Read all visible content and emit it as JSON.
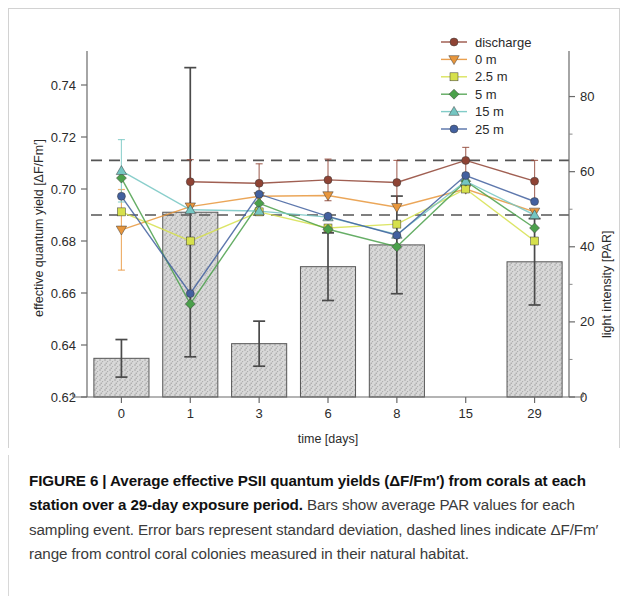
{
  "figure": {
    "caption_bold": "FIGURE 6 | Average effective PSII quantum yields (ΔF/Fm′) from corals at each station over a 29-day exposure period.",
    "caption_rest": " Bars show average PAR values for each sampling event. Error bars represent standard deviation, dashed lines indicate ΔF/Fm′ range from control coral colonies measured in their natural habitat."
  },
  "chart_data": {
    "type": "bar",
    "title": "",
    "xlabel": "time [days]",
    "ylabel": "effective quantum yield [ΔF/Fm′]",
    "y2label": "light intensity [PAR]",
    "categories": [
      "0",
      "1",
      "3",
      "6",
      "8",
      "15",
      "29"
    ],
    "ylim": [
      0.62,
      0.75
    ],
    "yticks": [
      "0.74",
      "0.72",
      "0.70",
      "0.68",
      "0.66",
      "0.64",
      "0.62"
    ],
    "ytick_values": [
      0.74,
      0.72,
      0.7,
      0.68,
      0.66,
      0.64,
      0.62
    ],
    "y2lim": [
      0,
      90
    ],
    "y2ticks": [
      "80",
      "60",
      "40",
      "20",
      "0"
    ],
    "y2tick_values": [
      80,
      60,
      40,
      20,
      0
    ],
    "grid": false,
    "legend_position": "top-right",
    "bars": {
      "name": "average PAR",
      "unit": "PAR",
      "color": "#c9c9c9",
      "edge_color": "#555555",
      "values": [
        10.3,
        49.2,
        14.2,
        34.7,
        40.5,
        0,
        36.0
      ],
      "errors": [
        5.0,
        38.5,
        6.0,
        9.0,
        13.0,
        0,
        11.5
      ]
    },
    "series": [
      {
        "name": "discharge",
        "color": "#8f4334",
        "marker": "circle",
        "values": [
          null,
          0.7028,
          0.7022,
          0.7035,
          0.7025,
          0.711,
          0.703
        ],
        "errors": [
          null,
          0.0085,
          0.0075,
          0.008,
          0.0085,
          0.005,
          0.008
        ]
      },
      {
        "name": "0 m",
        "color": "#e8963c",
        "marker": "triangle-down",
        "values": [
          0.6843,
          0.6932,
          0.6972,
          0.6975,
          0.693,
          0.7,
          0.6912
        ],
        "errors": [
          0.0155,
          0.0,
          0.0,
          0.0,
          0.0,
          0.0,
          0.0
        ]
      },
      {
        "name": "2.5 m",
        "color": "#d6e04c",
        "marker": "square",
        "values": [
          0.6912,
          0.68,
          0.6912,
          0.685,
          0.6865,
          0.7,
          0.68
        ],
        "errors": [
          0.0,
          0.0,
          0.0,
          0.0,
          0.0,
          0.0,
          0.0
        ]
      },
      {
        "name": "5 m",
        "color": "#4ba04b",
        "marker": "diamond",
        "values": [
          0.7042,
          0.6558,
          0.6945,
          0.6845,
          0.6778,
          0.703,
          0.685
        ],
        "errors": [
          0.0,
          0.0,
          0.0,
          0.0,
          0.0,
          0.0,
          0.0
        ]
      },
      {
        "name": "15 m",
        "color": "#74c6c2",
        "marker": "triangle-up",
        "values": [
          0.707,
          0.692,
          0.6915,
          0.6892,
          0.6825,
          0.703,
          0.69
        ],
        "errors": [
          0.012,
          0.0,
          0.0,
          0.0,
          0.0,
          0.0,
          0.0
        ]
      },
      {
        "name": "25 m",
        "color": "#42609f",
        "marker": "circle",
        "values": [
          0.6972,
          0.6598,
          0.698,
          0.6895,
          0.6822,
          0.7052,
          0.6952
        ],
        "errors": [
          0.0,
          0.0,
          0.0,
          0.0,
          0.0,
          0.0,
          0.0
        ]
      }
    ],
    "reference_lines": [
      {
        "name": "control-upper",
        "value": 0.711,
        "style": "dashed",
        "color": "#555555"
      },
      {
        "name": "control-lower",
        "value": 0.69,
        "style": "dashed",
        "color": "#555555"
      }
    ]
  }
}
